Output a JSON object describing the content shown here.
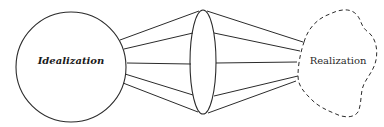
{
  "diagram": {
    "left_node": {
      "label": "Idealization",
      "shape": "circle"
    },
    "middle_node": {
      "shape": "lens-ellipse"
    },
    "right_node": {
      "label": "Realization",
      "shape": "dashed-cloud"
    },
    "connectors": {
      "left_to_lens_count": 5,
      "lens_to_right_count": 5
    },
    "colors": {
      "stroke": "#2b2b2b",
      "background": "#ffffff"
    }
  }
}
